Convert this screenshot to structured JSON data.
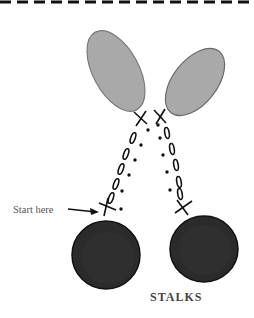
{
  "diagram": {
    "title": "STALKS",
    "annotation": "Start here",
    "colors": {
      "leaf": "#a9a9a9",
      "leaf_outline": "#6f6f6f",
      "cherry": "#2a2a2a",
      "ink": "#111111",
      "dash": "#111111"
    },
    "elements": {
      "leaves": 2,
      "cherries": 2,
      "stalks": 2
    },
    "stitch_legend": {
      "x": "single crochet / join",
      "oval": "chain",
      "dot": "slip stitch"
    }
  }
}
